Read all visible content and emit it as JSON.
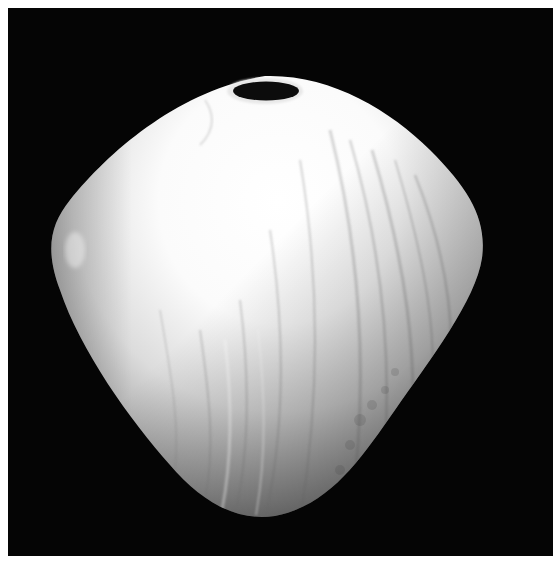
{
  "image": {
    "description": "Black-and-white photograph of a turned wood vessel with a small oval opening at the top, on a black background",
    "alt": "Turned wooden vessel photograph"
  },
  "colors": {
    "background": "#050505",
    "vessel_highlight": "#ffffff",
    "vessel_mid": "#d9d9d9",
    "vessel_shadow": "#7a7a7a",
    "opening": "#0c0c0c",
    "page": "#ffffff"
  }
}
